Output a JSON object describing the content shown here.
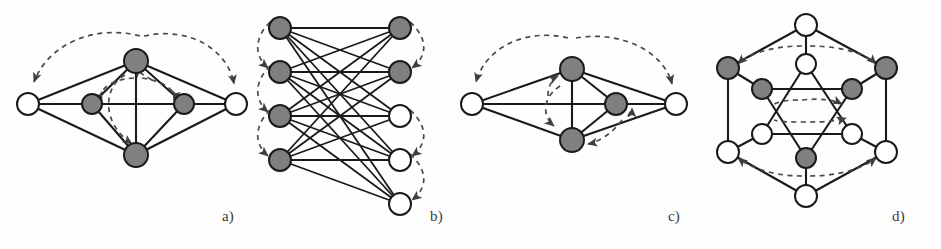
{
  "figure": {
    "width": 941,
    "height": 249,
    "background_color": "#fefefe",
    "node_fill_gray": "#808080",
    "node_fill_white": "#ffffff",
    "node_stroke_color": "#1a1a1a",
    "edge_color": "#1a1a1a",
    "dashed_arc_color": "#555555",
    "caption_color": "#3a3a3a"
  },
  "panels": [
    {
      "id": "a",
      "caption": "a)",
      "graph_type": "wheel-octahedron",
      "node_count": 6,
      "nodes": [
        {
          "name": "left-apex",
          "x": 28,
          "y": 104,
          "fill": "white",
          "r": 11
        },
        {
          "name": "right-apex",
          "x": 236,
          "y": 104,
          "fill": "white",
          "r": 11
        },
        {
          "name": "top-hub",
          "x": 136,
          "y": 61,
          "fill": "gray",
          "r": 12
        },
        {
          "name": "bottom-hub",
          "x": 136,
          "y": 155,
          "fill": "gray",
          "r": 12
        },
        {
          "name": "inner-left",
          "x": 92,
          "y": 104,
          "fill": "gray",
          "r": 10
        },
        {
          "name": "inner-right",
          "x": 184,
          "y": 104,
          "fill": "gray",
          "r": 10
        }
      ],
      "solid_edges": [
        [
          "left-apex",
          "top-hub"
        ],
        [
          "left-apex",
          "bottom-hub"
        ],
        [
          "left-apex",
          "inner-left"
        ],
        [
          "left-apex",
          "right-apex"
        ],
        [
          "right-apex",
          "top-hub"
        ],
        [
          "right-apex",
          "bottom-hub"
        ],
        [
          "right-apex",
          "inner-right"
        ],
        [
          "top-hub",
          "inner-left"
        ],
        [
          "top-hub",
          "inner-right"
        ],
        [
          "top-hub",
          "bottom-hub"
        ],
        [
          "bottom-hub",
          "inner-left"
        ],
        [
          "bottom-hub",
          "inner-right"
        ],
        [
          "inner-left",
          "inner-right"
        ]
      ],
      "dashed_arcs": [
        {
          "name": "outer-arc-left",
          "direction": "to-left-apex"
        },
        {
          "name": "outer-arc-right",
          "direction": "to-right-apex"
        },
        {
          "name": "inner-loop",
          "direction": "clockwise"
        }
      ]
    },
    {
      "id": "b",
      "caption": "b)",
      "graph_type": "complete-bipartite",
      "left_node_count": 4,
      "right_node_count": 5,
      "nodes_left": [
        {
          "name": "L1",
          "x": 32,
          "y": 28,
          "fill": "gray",
          "r": 11
        },
        {
          "name": "L2",
          "x": 32,
          "y": 72,
          "fill": "gray",
          "r": 11
        },
        {
          "name": "L3",
          "x": 32,
          "y": 116,
          "fill": "gray",
          "r": 11
        },
        {
          "name": "L4",
          "x": 32,
          "y": 160,
          "fill": "gray",
          "r": 11
        }
      ],
      "nodes_right": [
        {
          "name": "R1",
          "x": 152,
          "y": 28,
          "fill": "gray",
          "r": 11
        },
        {
          "name": "R2",
          "x": 152,
          "y": 72,
          "fill": "gray",
          "r": 11
        },
        {
          "name": "R3",
          "x": 152,
          "y": 116,
          "fill": "white",
          "r": 11
        },
        {
          "name": "R4",
          "x": 152,
          "y": 160,
          "fill": "white",
          "r": 11
        },
        {
          "name": "R5",
          "x": 152,
          "y": 204,
          "fill": "white",
          "r": 11
        }
      ],
      "dashed_arcs": [
        {
          "name": "left-arc-1",
          "side": "left"
        },
        {
          "name": "left-arc-2",
          "side": "left"
        },
        {
          "name": "left-arc-3",
          "side": "left"
        },
        {
          "name": "right-arc-1",
          "side": "right"
        },
        {
          "name": "right-arc-2",
          "side": "right"
        },
        {
          "name": "right-arc-3",
          "side": "right"
        }
      ]
    },
    {
      "id": "c",
      "caption": "c)",
      "graph_type": "wheel-reduced",
      "node_count": 5,
      "nodes": [
        {
          "name": "left-apex",
          "x": 20,
          "y": 104,
          "fill": "white",
          "r": 11
        },
        {
          "name": "right-apex",
          "x": 224,
          "y": 104,
          "fill": "white",
          "r": 11
        },
        {
          "name": "top-hub",
          "x": 120,
          "y": 69,
          "fill": "gray",
          "r": 12
        },
        {
          "name": "bottom-hub",
          "x": 120,
          "y": 140,
          "fill": "gray",
          "r": 12
        },
        {
          "name": "inner-right",
          "x": 164,
          "y": 104,
          "fill": "gray",
          "r": 11
        }
      ],
      "solid_edges": [
        [
          "left-apex",
          "top-hub"
        ],
        [
          "left-apex",
          "bottom-hub"
        ],
        [
          "left-apex",
          "right-apex"
        ],
        [
          "right-apex",
          "top-hub"
        ],
        [
          "right-apex",
          "bottom-hub"
        ],
        [
          "right-apex",
          "inner-right"
        ],
        [
          "top-hub",
          "bottom-hub"
        ],
        [
          "top-hub",
          "inner-right"
        ],
        [
          "bottom-hub",
          "inner-right"
        ]
      ],
      "dashed_arcs": [
        {
          "name": "outer-arc-left",
          "direction": "to-left-apex"
        },
        {
          "name": "outer-arc-right",
          "direction": "to-right-apex"
        },
        {
          "name": "inner-arc",
          "direction": "vertical-loop"
        },
        {
          "name": "lower-arc",
          "direction": "to-bottom-hub"
        }
      ]
    },
    {
      "id": "d",
      "caption": "d)",
      "graph_type": "hexagon-hexagram",
      "outer_node_count": 6,
      "inner_node_count": 6,
      "nodes_outer": [
        {
          "name": "O-top",
          "x": 116,
          "y": 25,
          "fill": "white",
          "r": 11
        },
        {
          "name": "O-upper-right",
          "x": 196,
          "y": 68,
          "fill": "gray",
          "r": 11
        },
        {
          "name": "O-lower-right",
          "x": 196,
          "y": 152,
          "fill": "white",
          "r": 11
        },
        {
          "name": "O-bottom",
          "x": 116,
          "y": 196,
          "fill": "white",
          "r": 11
        },
        {
          "name": "O-lower-left",
          "x": 38,
          "y": 152,
          "fill": "white",
          "r": 11
        },
        {
          "name": "O-upper-left",
          "x": 38,
          "y": 68,
          "fill": "gray",
          "r": 11
        }
      ],
      "nodes_inner": [
        {
          "name": "I-top",
          "x": 116,
          "y": 64,
          "fill": "white",
          "r": 10
        },
        {
          "name": "I-upper-right",
          "x": 162,
          "y": 89,
          "fill": "gray",
          "r": 10
        },
        {
          "name": "I-lower-right",
          "x": 162,
          "y": 134,
          "fill": "white",
          "r": 10
        },
        {
          "name": "I-bottom",
          "x": 116,
          "y": 158,
          "fill": "gray",
          "r": 10
        },
        {
          "name": "I-lower-left",
          "x": 72,
          "y": 134,
          "fill": "white",
          "r": 10
        },
        {
          "name": "I-upper-left",
          "x": 72,
          "y": 89,
          "fill": "gray",
          "r": 10
        }
      ],
      "dashed_arcs": [
        {
          "name": "top-arc",
          "direction": "bidirectional"
        },
        {
          "name": "bottom-arc",
          "direction": "bidirectional"
        },
        {
          "name": "inner-arc-upper",
          "direction": "bidirectional"
        },
        {
          "name": "inner-arc-lower",
          "direction": "bidirectional"
        }
      ]
    }
  ]
}
